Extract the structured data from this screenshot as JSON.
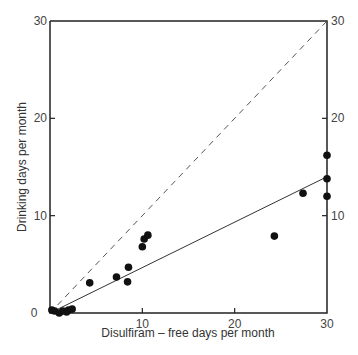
{
  "chart_data": {
    "type": "scatter",
    "title": "",
    "xlabel": "Disulfiram – free days per month",
    "ylabel": "Drinking days per month",
    "xlim": [
      0,
      30
    ],
    "ylim": [
      0,
      30
    ],
    "x_ticks": [
      "0",
      "10",
      "20",
      "30"
    ],
    "y_ticks_left": [
      "0",
      "10",
      "20",
      "30"
    ],
    "y_ticks_right": [
      "10",
      "20",
      "30"
    ],
    "grid": false,
    "legend": null,
    "series": [
      {
        "name": "patients",
        "marker": "filled-circle",
        "points": [
          {
            "x": 0.2,
            "y": 0.3
          },
          {
            "x": 0.5,
            "y": 0.2
          },
          {
            "x": 1.0,
            "y": 0.0
          },
          {
            "x": 1.4,
            "y": 0.2
          },
          {
            "x": 1.8,
            "y": 0.1
          },
          {
            "x": 2.0,
            "y": 0.3
          },
          {
            "x": 2.4,
            "y": 0.4
          },
          {
            "x": 4.3,
            "y": 3.1
          },
          {
            "x": 7.2,
            "y": 3.7
          },
          {
            "x": 8.4,
            "y": 3.2
          },
          {
            "x": 8.5,
            "y": 4.7
          },
          {
            "x": 10.0,
            "y": 6.8
          },
          {
            "x": 10.2,
            "y": 7.6
          },
          {
            "x": 10.6,
            "y": 8.0
          },
          {
            "x": 24.3,
            "y": 7.9
          },
          {
            "x": 27.4,
            "y": 12.3
          },
          {
            "x": 30.0,
            "y": 16.2
          },
          {
            "x": 30.0,
            "y": 13.8
          },
          {
            "x": 30.0,
            "y": 12.0
          }
        ]
      }
    ],
    "lines": [
      {
        "name": "identity (y = x)",
        "style": "dashed",
        "from": {
          "x": 0,
          "y": 0
        },
        "to": {
          "x": 30,
          "y": 30
        }
      },
      {
        "name": "regression fit",
        "style": "solid",
        "from": {
          "x": 0,
          "y": 0
        },
        "to": {
          "x": 30,
          "y": 14
        }
      }
    ]
  },
  "labels": {
    "xlabel": "Disulfiram – free days per month",
    "ylabel": "Drinking days per month"
  }
}
